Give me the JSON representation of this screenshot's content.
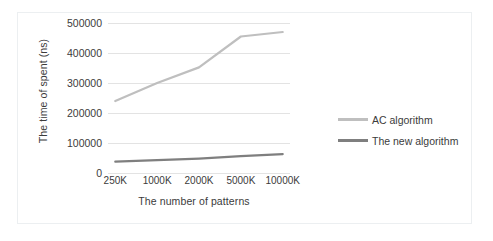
{
  "chart_data": {
    "type": "line",
    "title": "",
    "xlabel": "The number of patterns",
    "ylabel": "The time of spent (ns)",
    "categories": [
      "250K",
      "1000K",
      "2000K",
      "5000K",
      "10000K"
    ],
    "ylim": [
      0,
      500000
    ],
    "yticks": [
      "0",
      "100000",
      "200000",
      "300000",
      "400000",
      "500000"
    ],
    "ytick_values": [
      0,
      100000,
      200000,
      300000,
      400000,
      500000
    ],
    "grid": true,
    "legend_position": "right",
    "series": [
      {
        "name": "AC algorithm",
        "color": "#bfbfbf",
        "values": [
          240000,
          300000,
          352000,
          455000,
          470000
        ]
      },
      {
        "name": "The new algorithm",
        "color": "#7f7f7f",
        "values": [
          38000,
          43000,
          48000,
          56000,
          63000
        ]
      }
    ]
  },
  "legend": {
    "entries": [
      {
        "label": "AC algorithm",
        "color": "#bfbfbf"
      },
      {
        "label": "The new algorithm",
        "color": "#7f7f7f"
      }
    ]
  }
}
